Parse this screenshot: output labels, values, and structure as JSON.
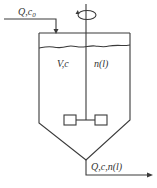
{
  "diagram": {
    "type": "continuous stirred tank (crystallizer) schematic",
    "colors": {
      "line": "#3a3a3a",
      "text": "#333333",
      "background": "#ffffff"
    },
    "inlet": {
      "label_main": "Q,c",
      "label_sub": "0",
      "description": "feed stream entering top of tank"
    },
    "tank_labels": {
      "volume_concentration": "V,c",
      "distribution": "n(l)"
    },
    "outlet": {
      "label": "Q,c,n(l)",
      "description": "product stream leaving bottom of conical tank"
    },
    "agitator": {
      "rotation_icon": "rotation-arrow-icon",
      "impeller": "two-blade paddle impeller"
    }
  }
}
